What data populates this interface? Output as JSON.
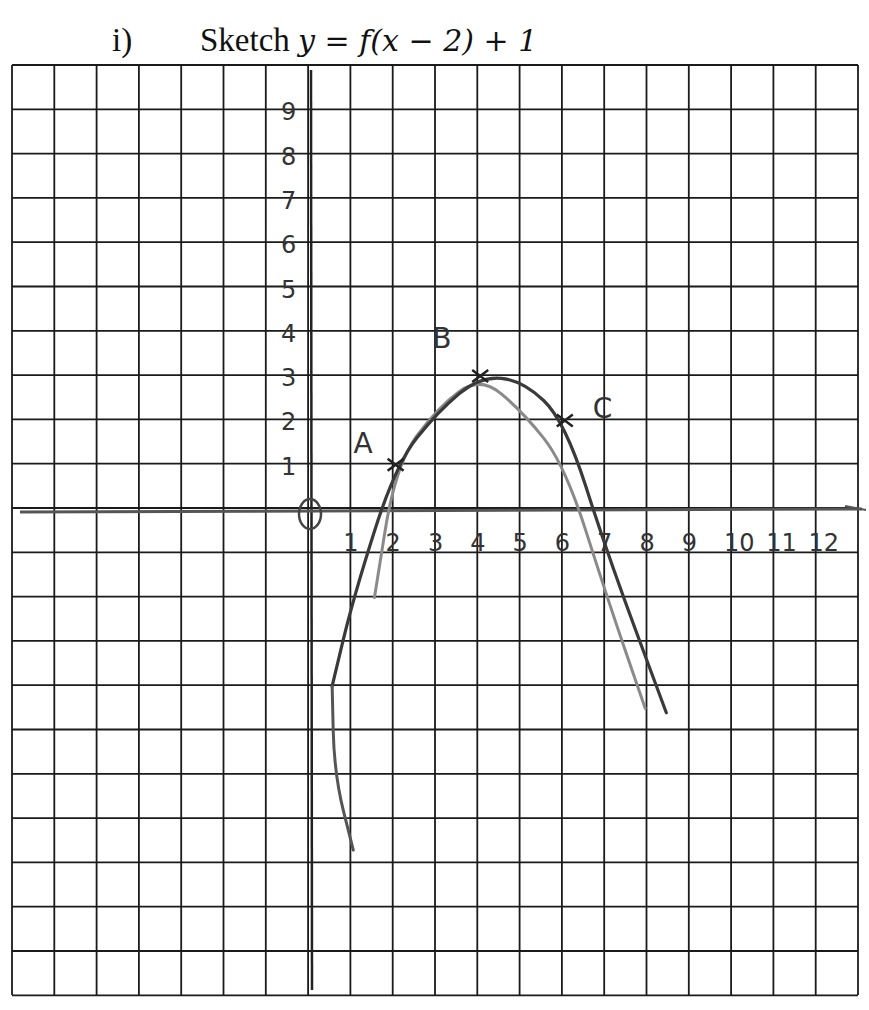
{
  "question": {
    "number": "i)",
    "instruction": "Sketch",
    "equation": "y = f(x − 2) + 1"
  },
  "chart_data": {
    "type": "line",
    "title": "Sketch y = f(x − 2) + 1",
    "xlabel": "",
    "ylabel": "",
    "grid": true,
    "x_tick_labels": [
      "1",
      "2",
      "3",
      "4",
      "5",
      "6",
      "7",
      "8",
      "9",
      "10",
      "11",
      "12"
    ],
    "y_tick_labels": [
      "1",
      "2",
      "3",
      "4",
      "5",
      "6",
      "7",
      "8",
      "9"
    ],
    "origin_label": "O",
    "xlim": [
      -7,
      13
    ],
    "ylim": [
      -11,
      10
    ],
    "series": [
      {
        "name": "original curve y = f(x) (lighter)",
        "points": [
          [
            1.5,
            -2
          ],
          [
            2,
            1
          ],
          [
            3,
            2.3
          ],
          [
            4,
            3
          ],
          [
            5,
            2.2
          ],
          [
            6,
            1
          ],
          [
            7,
            -2
          ],
          [
            7.9,
            -4.5
          ]
        ]
      },
      {
        "name": "transformed curve y = f(x-2)+1 (darker)",
        "points": [
          [
            0.5,
            -4
          ],
          [
            1,
            -2
          ],
          [
            2,
            1
          ],
          [
            3,
            2.2
          ],
          [
            4,
            3
          ],
          [
            5,
            2.9
          ],
          [
            6,
            2
          ],
          [
            7,
            -1
          ],
          [
            8.4,
            -4.6
          ]
        ]
      },
      {
        "name": "left tail (hand-drawn)",
        "points": [
          [
            0.5,
            -4
          ],
          [
            0.55,
            -6
          ],
          [
            1,
            -7.7
          ]
        ]
      }
    ],
    "annotations": [
      {
        "label": "A",
        "x": 2,
        "y": 1
      },
      {
        "label": "B",
        "x": 4,
        "y": 3
      },
      {
        "label": "C",
        "x": 6,
        "y": 2
      }
    ]
  }
}
